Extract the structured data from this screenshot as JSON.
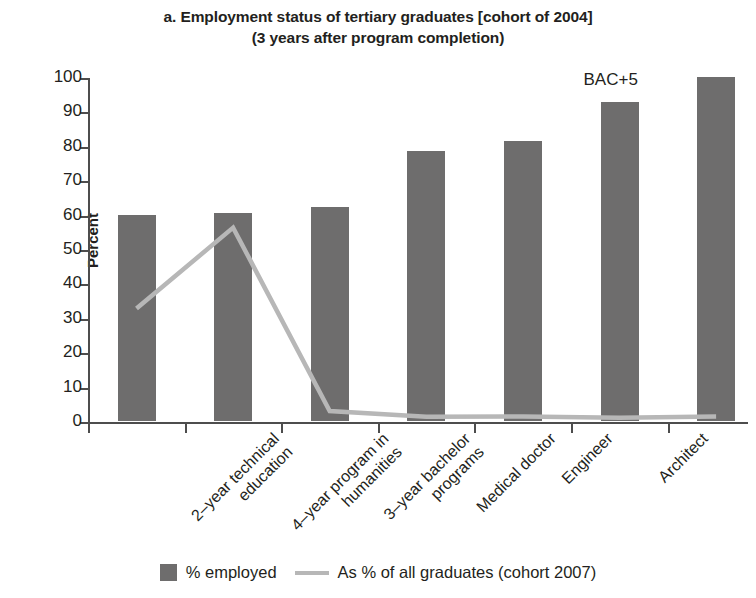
{
  "chart_data": {
    "type": "bar",
    "title": "a. Employment status of tertiary graduates [cohort of 2004]",
    "subtitle": "(3 years after program completion)",
    "xlabel": "",
    "ylabel": "Percent",
    "ylim": [
      0,
      100
    ],
    "yticks": [
      0,
      10,
      20,
      30,
      40,
      50,
      60,
      70,
      80,
      90,
      100
    ],
    "ytick_labels": [
      "0",
      "10",
      "20",
      "30",
      "40",
      "50",
      "60",
      "70",
      "80",
      "90",
      "100"
    ],
    "grid": false,
    "legend_position": "bottom",
    "categories": [
      "2–year technical education",
      "4–year program in humanities",
      "3–year bachelor programs",
      "Medical doctor",
      "Engineer",
      "Architect",
      "Master's degree"
    ],
    "category_lines": [
      [
        "2–year technical",
        "education"
      ],
      [
        "4–year program in",
        "humanities"
      ],
      [
        "3–year bachelor",
        "programs"
      ],
      [
        "Medical doctor"
      ],
      [
        "Engineer"
      ],
      [
        "Architect"
      ],
      [
        "Master's degree"
      ]
    ],
    "series": [
      {
        "name": "% employed",
        "type": "bar",
        "color": "#6e6d6d",
        "values": [
          59.8,
          60.5,
          62.3,
          78.6,
          81.4,
          92.8,
          100.0
        ]
      },
      {
        "name": "As % of all graduates (cohort 2007)",
        "type": "line",
        "color": "#b7b7b7",
        "values": [
          33.0,
          56.5,
          3.2,
          1.5,
          1.6,
          1.2,
          1.6
        ]
      }
    ],
    "annotations": [
      {
        "text": "BAC+5",
        "category": "Architect",
        "value": 97
      }
    ],
    "legend": [
      {
        "label": "% employed",
        "marker": "square",
        "color": "#6e6d6d"
      },
      {
        "label": "As % of all graduates (cohort 2007)",
        "marker": "line",
        "color": "#b7b7b7"
      }
    ]
  }
}
